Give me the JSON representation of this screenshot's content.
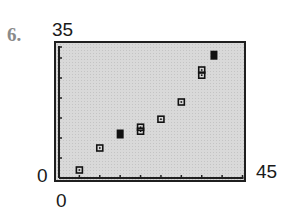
{
  "problem": {
    "number": "6."
  },
  "chart_data": {
    "type": "scatter",
    "title": "",
    "xlabel": "",
    "ylabel": "",
    "xlim": [
      0,
      45
    ],
    "ylim": [
      0,
      35
    ],
    "x_tick_step": 5,
    "y_tick_step": 5,
    "window_labels": {
      "ymax": "35",
      "ymin": "0",
      "xmin": "0",
      "xmax": "45"
    },
    "grid": false,
    "legend": null,
    "points": [
      {
        "x": 5,
        "y": 2,
        "filled": false
      },
      {
        "x": 10,
        "y": 7.5,
        "filled": false
      },
      {
        "x": 15,
        "y": 11,
        "filled": true
      },
      {
        "x": 20,
        "y": 11.7,
        "filled": false
      },
      {
        "x": 20,
        "y": 12.7,
        "filled": false
      },
      {
        "x": 25,
        "y": 14.7,
        "filled": false
      },
      {
        "x": 30,
        "y": 19,
        "filled": false
      },
      {
        "x": 35,
        "y": 25.7,
        "filled": false
      },
      {
        "x": 35,
        "y": 27,
        "filled": false
      },
      {
        "x": 38,
        "y": 30.7,
        "filled": true
      }
    ]
  },
  "style": {
    "marker_color": "#111111",
    "axis_color": "#1f1f1f",
    "screen_bg": "#d9d9d9"
  }
}
